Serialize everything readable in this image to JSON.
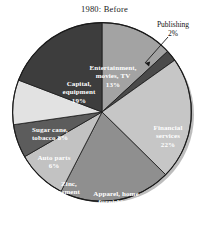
{
  "chart_data": {
    "type": "pie",
    "title": "1980: Before",
    "xlabel": "",
    "ylabel": "",
    "legend_position": "none",
    "grid": false,
    "start_angle_deg": 0,
    "direction": "clockwise",
    "categories": [
      "Entertainment, movies, TV",
      "Publishing",
      "Financial services",
      "Apparel, home furnishings",
      "Zinc, cement",
      "Auto parts",
      "Sugar cane, tobacco",
      "Capital, equipment"
    ],
    "values": [
      13,
      2,
      22,
      20,
      9,
      6,
      8,
      19
    ],
    "value_unit": "%",
    "slices": [
      {
        "label": "Entertainment, movies, TV",
        "label_line1": "Entertainment,",
        "label_line2": "movies, TV",
        "value": 13,
        "value_text": "13%",
        "color": "#a3a3a3",
        "label_placement": "inside",
        "text_color": "light"
      },
      {
        "label": "Publishing",
        "label_line1": "Publishing",
        "label_line2": "",
        "value": 2,
        "value_text": "2%",
        "color": "#4a4a4a",
        "label_placement": "callout",
        "text_color": "dark"
      },
      {
        "label": "Financial services",
        "label_line1": "Financial",
        "label_line2": "services",
        "value": 22,
        "value_text": "22%",
        "color": "#c6c6c6",
        "label_placement": "inside",
        "text_color": "light"
      },
      {
        "label": "Apparel, home furnishings",
        "label_line1": "Apparel, home",
        "label_line2": "furnishings",
        "value": 20,
        "value_text": "20%",
        "color": "#8f8f8f",
        "label_placement": "inside",
        "text_color": "light"
      },
      {
        "label": "Zinc, cement",
        "label_line1": "Zinc,",
        "label_line2": "cement",
        "value": 9,
        "value_text": "9%",
        "color": "#c2c2c2",
        "label_placement": "inside",
        "text_color": "light"
      },
      {
        "label": "Auto parts",
        "label_line1": "Auto parts",
        "label_line2": "",
        "value": 6,
        "value_text": "6%",
        "color": "#5c5c5c",
        "label_placement": "inside",
        "text_color": "light"
      },
      {
        "label": "Sugar cane, tobacco",
        "label_line1": "Sugar cane,",
        "label_line2": "tobacco 8%",
        "value": 8,
        "value_text": "8%",
        "color": "#e2e2e2",
        "label_placement": "inside",
        "text_color": "light"
      },
      {
        "label": "Capital, equipment",
        "label_line1": "Capital,",
        "label_line2": "equipment",
        "value": 19,
        "value_text": "19%",
        "color": "#3d3d3d",
        "label_placement": "inside",
        "text_color": "light"
      }
    ]
  },
  "colors": {
    "background": "#ffffff",
    "outline": "#1a1a1a",
    "shadow": "#bdbdbd",
    "title_text": "#1a1a1a",
    "callout_text": "#111111"
  }
}
